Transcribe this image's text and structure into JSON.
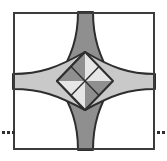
{
  "figure": {
    "background_color": "#ffffff",
    "canvas": {
      "width": 167,
      "height": 161
    },
    "border_square": {
      "name": "outer-square-border",
      "x": 13,
      "y": 12,
      "width": 142,
      "height": 138,
      "stroke_color": "#3c3c3c",
      "stroke_width": 2,
      "fill_color": "#ffffff"
    },
    "outline": {
      "stroke_color": "#2e2e2e",
      "stroke_width": 2
    },
    "center": {
      "x": 85,
      "y": 81
    },
    "diamond": {
      "name": "center-diamond",
      "top": {
        "x": 85,
        "y": 52
      },
      "right": {
        "x": 113,
        "y": 81
      },
      "bottom": {
        "x": 85,
        "y": 110
      },
      "left": {
        "x": 57,
        "y": 81
      },
      "quadrants": [
        {
          "name": "diamond-quadrant-top-left",
          "fill_color": "#8f8f8f",
          "tone": "dark"
        },
        {
          "name": "diamond-quadrant-top-right",
          "fill_color": "#e6e6e6",
          "tone": "light"
        },
        {
          "name": "diamond-quadrant-bottom-right",
          "fill_color": "#8f8f8f",
          "tone": "dark"
        },
        {
          "name": "diamond-quadrant-bottom-left",
          "fill_color": "#e6e6e6",
          "tone": "light"
        }
      ]
    },
    "arms": [
      {
        "name": "arm-top",
        "direction": "up",
        "fill_color": "#8f8f8f",
        "tone": "dark",
        "base_start": {
          "x": 78,
          "y": 12
        },
        "base_end": {
          "x": 93,
          "y": 12
        }
      },
      {
        "name": "arm-bottom",
        "direction": "down",
        "fill_color": "#8f8f8f",
        "tone": "dark",
        "base_start": {
          "x": 78,
          "y": 150
        },
        "base_end": {
          "x": 93,
          "y": 150
        }
      },
      {
        "name": "arm-left",
        "direction": "left",
        "fill_color": "#c9c9c9",
        "tone": "medium",
        "base_start": {
          "x": 13,
          "y": 74
        },
        "base_end": {
          "x": 13,
          "y": 89
        }
      },
      {
        "name": "arm-right",
        "direction": "right",
        "fill_color": "#c9c9c9",
        "tone": "medium",
        "base_start": {
          "x": 155,
          "y": 74
        },
        "base_end": {
          "x": 155,
          "y": 89
        }
      }
    ],
    "corners": [
      {
        "name": "corner-region-top-left",
        "fill_color": "#ffffff"
      },
      {
        "name": "corner-region-top-right",
        "fill_color": "#ffffff"
      },
      {
        "name": "corner-region-bottom-right",
        "fill_color": "#ffffff"
      },
      {
        "name": "corner-region-bottom-left",
        "fill_color": "#ffffff"
      }
    ],
    "ellipsis_marks": [
      {
        "name": "ellipsis-left",
        "color": "#2e2e2e",
        "dot_size": 3,
        "y": 132,
        "dots_x": [
          2,
          7,
          12
        ]
      },
      {
        "name": "ellipsis-right",
        "color": "#2e2e2e",
        "dot_size": 3,
        "y": 132,
        "dots_x": [
          157,
          162
        ]
      }
    ]
  }
}
